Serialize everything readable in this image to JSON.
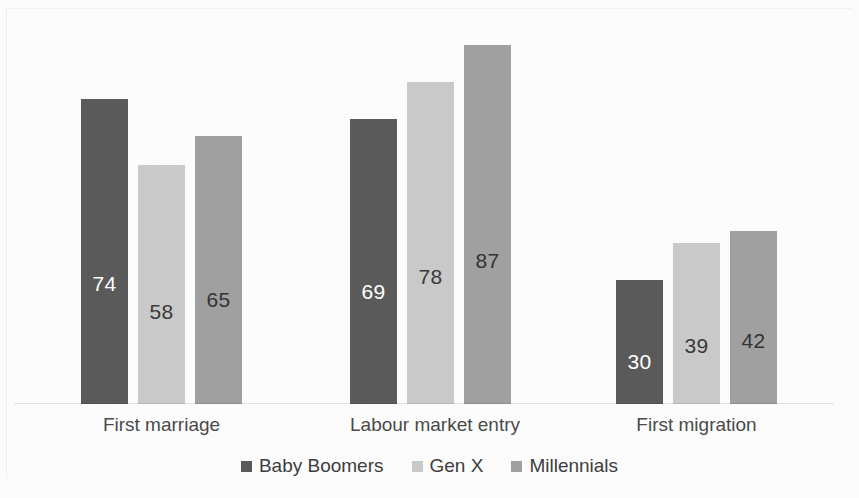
{
  "chart_data": {
    "type": "bar",
    "title": "",
    "subtitle": "",
    "xlabel": "",
    "ylabel": "",
    "grid": false,
    "legend_position": "bottom",
    "axis_visible": false,
    "ylim": [
      0,
      92
    ],
    "categories": [
      "First marriage",
      "Labour market entry",
      "First migration"
    ],
    "series": [
      {
        "name": "Baby Boomers",
        "color": "#5a5a5a",
        "label_color": "#ffffff",
        "values": [
          74,
          69,
          30
        ]
      },
      {
        "name": "Gen X",
        "color": "#c9c9c9",
        "label_color": "#3a3a3a",
        "values": [
          58,
          78,
          39
        ]
      },
      {
        "name": "Millennials",
        "color": "#a0a0a0",
        "label_color": "#333333",
        "values": [
          65,
          87,
          42
        ]
      }
    ],
    "data_labels": {
      "first_marriage": {
        "baby_boomers": "74",
        "gen_x": "58",
        "millennials": "65"
      },
      "labour_market_entry": {
        "baby_boomers": "69",
        "gen_x": "78",
        "millennials": "87"
      },
      "first_migration": {
        "baby_boomers": "30",
        "gen_x": "39",
        "millennials": "42"
      }
    }
  },
  "legend": {
    "items": [
      {
        "label": "Baby Boomers",
        "color": "#5a5a5a"
      },
      {
        "label": "Gen X",
        "color": "#c9c9c9"
      },
      {
        "label": "Millennials",
        "color": "#a0a0a0"
      }
    ]
  },
  "categories": [
    {
      "label": "First marriage"
    },
    {
      "label": "Labour market entry"
    },
    {
      "label": "First migration"
    }
  ],
  "bars": [
    {
      "value": "74",
      "series": "Baby Boomers",
      "category": "First marriage"
    },
    {
      "value": "58",
      "series": "Gen X",
      "category": "First marriage"
    },
    {
      "value": "65",
      "series": "Millennials",
      "category": "First marriage"
    },
    {
      "value": "69",
      "series": "Baby Boomers",
      "category": "Labour market entry"
    },
    {
      "value": "78",
      "series": "Gen X",
      "category": "Labour market entry"
    },
    {
      "value": "87",
      "series": "Millennials",
      "category": "Labour market entry"
    },
    {
      "value": "30",
      "series": "Baby Boomers",
      "category": "First migration"
    },
    {
      "value": "39",
      "series": "Gen X",
      "category": "First migration"
    },
    {
      "value": "42",
      "series": "Millennials",
      "category": "First migration"
    }
  ]
}
